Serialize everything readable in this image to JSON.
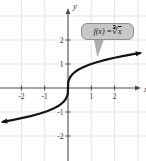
{
  "figure": {
    "x_axis_label": "x",
    "y_axis_label": "y",
    "callout": {
      "prefix": "f(x) = ",
      "radical_symbol": "∛",
      "radicand": "x",
      "full_text": "f(x) = ∛x"
    }
  },
  "colors": {
    "curve": "#141414",
    "axis": "#4d4d4d",
    "grid": "#dfe5df",
    "tick_text": "#333333",
    "callout_bg": "#c7c7c7",
    "callout_border": "#8f8f8f",
    "callout_tail": "#adadad"
  },
  "chart_data": {
    "type": "line",
    "function_label": "f(x) = ∛x",
    "grid": true,
    "xlim": [
      -2.9,
      3.35
    ],
    "ylim": [
      -3.0,
      3.65
    ],
    "x_ticks": [
      -2,
      -1,
      1,
      2
    ],
    "y_ticks": [
      2,
      1,
      -1,
      -2
    ],
    "grid_x": [
      -2,
      -1,
      1,
      2,
      3
    ],
    "grid_y": [
      3,
      2,
      1,
      -1,
      -2
    ],
    "series": [
      {
        "name": "f(x) = ∛x",
        "points": [
          [
            -2.8,
            -1.409
          ],
          [
            -2.4,
            -1.339
          ],
          [
            -2.0,
            -1.26
          ],
          [
            -1.6,
            -1.17
          ],
          [
            -1.2,
            -1.063
          ],
          [
            -0.9,
            -0.965
          ],
          [
            -0.6,
            -0.843
          ],
          [
            -0.4,
            -0.737
          ],
          [
            -0.25,
            -0.63
          ],
          [
            -0.15,
            -0.531
          ],
          [
            -0.08,
            -0.431
          ],
          [
            -0.03,
            -0.311
          ],
          [
            -0.01,
            -0.215
          ],
          [
            0,
            0
          ],
          [
            0.01,
            0.215
          ],
          [
            0.03,
            0.311
          ],
          [
            0.08,
            0.431
          ],
          [
            0.15,
            0.531
          ],
          [
            0.25,
            0.63
          ],
          [
            0.4,
            0.737
          ],
          [
            0.6,
            0.843
          ],
          [
            0.9,
            0.965
          ],
          [
            1.2,
            1.063
          ],
          [
            1.6,
            1.17
          ],
          [
            2.0,
            1.26
          ],
          [
            2.4,
            1.339
          ],
          [
            2.8,
            1.409
          ],
          [
            3.1,
            1.458
          ]
        ]
      }
    ]
  }
}
